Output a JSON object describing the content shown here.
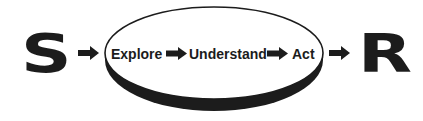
{
  "diagram": {
    "type": "flow",
    "stimulus": {
      "label": "S"
    },
    "response": {
      "label": "R"
    },
    "process_ellipse": {
      "steps": [
        {
          "label": "Explore"
        },
        {
          "label": "Understand"
        },
        {
          "label": "Act"
        }
      ]
    },
    "connections": [
      {
        "from": "S",
        "to": "Explore"
      },
      {
        "from": "Explore",
        "to": "Understand"
      },
      {
        "from": "Understand",
        "to": "Act"
      },
      {
        "from": "Act",
        "to": "R"
      }
    ],
    "colors": {
      "ink": "#1c1c1c",
      "background": "#ffffff"
    }
  }
}
